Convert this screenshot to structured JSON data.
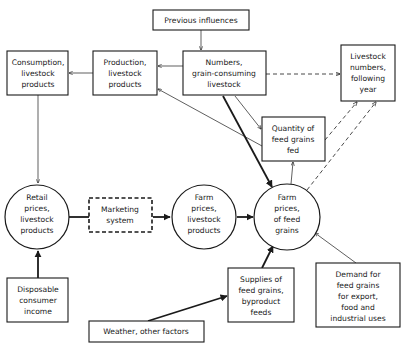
{
  "diagram": {
    "nodes": {
      "previous_influences": {
        "lines": [
          "Previous influences"
        ]
      },
      "consumption": {
        "lines": [
          "Consumption,",
          "livestock",
          "products"
        ]
      },
      "production": {
        "lines": [
          "Production,",
          "livestock",
          "products"
        ]
      },
      "numbers": {
        "lines": [
          "Numbers,",
          "grain-consuming",
          "livestock"
        ]
      },
      "livestock_following": {
        "lines": [
          "Livestock",
          "numbers,",
          "following",
          "year"
        ]
      },
      "quantity_fed": {
        "lines": [
          "Quantity of",
          "feed grains",
          "fed"
        ]
      },
      "retail_prices": {
        "lines": [
          "Retail",
          "prices,",
          "livestock",
          "products"
        ]
      },
      "marketing": {
        "lines": [
          "Marketing",
          "system"
        ]
      },
      "farm_prices_livestock": {
        "lines": [
          "Farm",
          "prices,",
          "livestock",
          "products"
        ]
      },
      "farm_prices_feed": {
        "lines": [
          "Farm",
          "prices,",
          "of feed",
          "grains"
        ]
      },
      "disposable_income": {
        "lines": [
          "Disposable",
          "consumer",
          "income"
        ]
      },
      "supplies": {
        "lines": [
          "Supplies of",
          "feed grains,",
          "byproduct",
          "feeds"
        ]
      },
      "demand": {
        "lines": [
          "Demand for",
          "feed grains",
          "for export,",
          "food and",
          "industrial uses"
        ]
      },
      "weather": {
        "lines": [
          "Weather, other factors"
        ]
      }
    },
    "edges": [
      {
        "from": "previous_influences",
        "to": "numbers",
        "style": "thin"
      },
      {
        "from": "numbers",
        "to": "production",
        "style": "thin"
      },
      {
        "from": "production",
        "to": "consumption",
        "style": "thin"
      },
      {
        "from": "numbers",
        "to": "livestock_following",
        "style": "dashed"
      },
      {
        "from": "numbers",
        "to": "quantity_fed",
        "style": "thin"
      },
      {
        "from": "numbers",
        "to": "farm_prices_feed",
        "style": "thick"
      },
      {
        "from": "quantity_fed",
        "to": "production",
        "style": "thin"
      },
      {
        "from": "farm_prices_feed",
        "to": "quantity_fed",
        "style": "thin"
      },
      {
        "from": "quantity_fed",
        "to": "livestock_following",
        "style": "dashed"
      },
      {
        "from": "farm_prices_feed",
        "to": "livestock_following",
        "style": "dashed"
      },
      {
        "from": "consumption",
        "to": "retail_prices",
        "style": "thin"
      },
      {
        "from": "retail_prices",
        "to": "marketing",
        "style": "thick"
      },
      {
        "from": "marketing",
        "to": "farm_prices_livestock",
        "style": "thick"
      },
      {
        "from": "farm_prices_livestock",
        "to": "farm_prices_feed",
        "style": "thick"
      },
      {
        "from": "disposable_income",
        "to": "retail_prices",
        "style": "thick"
      },
      {
        "from": "supplies",
        "to": "farm_prices_feed",
        "style": "thick"
      },
      {
        "from": "weather",
        "to": "supplies",
        "style": "thick"
      },
      {
        "from": "demand",
        "to": "farm_prices_feed",
        "style": "thin"
      }
    ]
  }
}
